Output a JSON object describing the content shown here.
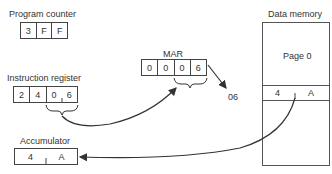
{
  "program_counter": {
    "label": "Program counter",
    "cells": [
      "3",
      "F",
      "F"
    ]
  },
  "instruction_register": {
    "label": "Instruction register",
    "cells": [
      "2",
      "4",
      "0",
      "6"
    ]
  },
  "mar": {
    "label": "MAR",
    "cells": [
      "0",
      "0",
      "0",
      "6"
    ]
  },
  "address_output": "06",
  "data_memory": {
    "label": "Data memory",
    "page_label": "Page 0",
    "row_cells": [
      "4",
      "A"
    ]
  },
  "accumulator": {
    "label": "Accumulator",
    "cells": [
      "4",
      "A"
    ]
  },
  "colors": {
    "line": "#333333",
    "background": "#ffffff"
  }
}
